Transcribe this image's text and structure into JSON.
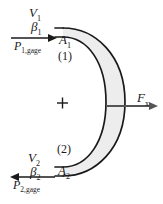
{
  "figure": {
    "kind": "control-volume-diagram",
    "width": 163,
    "height": 204
  },
  "colors": {
    "stroke": "#1a1a1a",
    "vane_fill": "#ededed",
    "background": "#ffffff",
    "text": "#1a1a1a"
  },
  "inlet": {
    "velocity": "V",
    "velocity_sub": "1",
    "beta": "β",
    "beta_sub": "1",
    "pressure": "P",
    "pressure_sub": "1,gage",
    "area": "A",
    "area_sub": "1",
    "section": "(1)"
  },
  "outlet": {
    "velocity": "V",
    "velocity_sub": "2",
    "beta": "β",
    "beta_sub": "2",
    "pressure": "P",
    "pressure_sub": "2,gage",
    "area": "A",
    "area_sub": "2",
    "section": "(2)"
  },
  "force": {
    "symbol": "F",
    "symbol_sub": "x"
  },
  "centroid": {
    "marker": "+"
  }
}
